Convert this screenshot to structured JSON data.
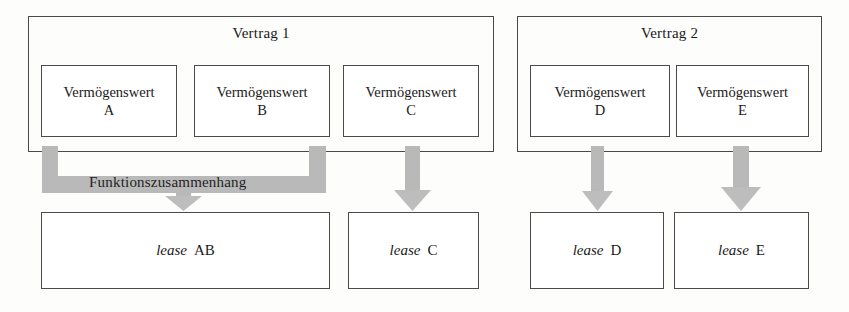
{
  "diagram": {
    "colors": {
      "outline": "#4a4a4a",
      "connector_grey": "#b9b9b9",
      "connector_grey_dark": "#a9a9a9",
      "background": "#fdfdfc",
      "text": "#1a1a1a"
    },
    "contracts": [
      {
        "id": "vertrag-1",
        "label": "Vertrag 1",
        "assets": [
          {
            "id": "asset-a",
            "line1": "Vermögenswert",
            "line2": "A"
          },
          {
            "id": "asset-b",
            "line1": "Vermögenswert",
            "line2": "B"
          },
          {
            "id": "asset-c",
            "line1": "Vermögenswert",
            "line2": "C"
          }
        ]
      },
      {
        "id": "vertrag-2",
        "label": "Vertrag 2",
        "assets": [
          {
            "id": "asset-d",
            "line1": "Vermögenswert",
            "line2": "D"
          },
          {
            "id": "asset-e",
            "line1": "Vermögenswert",
            "line2": "E"
          }
        ]
      }
    ],
    "connector_label": "Funktionszusammenhang",
    "leases": [
      {
        "id": "lease-ab",
        "word": "lease",
        "code": "AB"
      },
      {
        "id": "lease-c",
        "word": "lease",
        "code": "C"
      },
      {
        "id": "lease-d",
        "word": "lease",
        "code": "D"
      },
      {
        "id": "lease-e",
        "word": "lease",
        "code": "E"
      }
    ],
    "arrows": [
      {
        "id": "arrow-ab",
        "from": "funktionszusammenhang-bracket",
        "to": "lease-ab"
      },
      {
        "id": "arrow-c",
        "from": "asset-c",
        "to": "lease-c"
      },
      {
        "id": "arrow-d",
        "from": "asset-d",
        "to": "lease-d"
      },
      {
        "id": "arrow-e",
        "from": "asset-e",
        "to": "lease-e"
      }
    ]
  }
}
